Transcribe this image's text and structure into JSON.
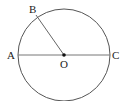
{
  "diagram": {
    "type": "circle-geometry",
    "points": {
      "A": {
        "label": "A",
        "x": 18,
        "y": 55
      },
      "B": {
        "label": "B",
        "x": 36,
        "y": 15
      },
      "C": {
        "label": "C",
        "x": 110,
        "y": 55
      },
      "O": {
        "label": "O",
        "x": 64,
        "y": 55
      }
    },
    "circle": {
      "center": "O",
      "cx": 64,
      "cy": 55,
      "r": 46
    },
    "segments": [
      {
        "from": "A",
        "to": "C",
        "name": "diameter-AC"
      },
      {
        "from": "B",
        "to": "O",
        "name": "radius-BO"
      }
    ],
    "colors": {
      "stroke": "#555555",
      "text": "#222222"
    }
  }
}
